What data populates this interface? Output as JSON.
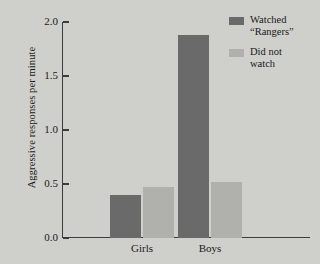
{
  "chart_data": {
    "type": "bar",
    "title": "",
    "xlabel": "",
    "ylabel": "Aggressive responses per minute",
    "categories": [
      "Girls",
      "Boys"
    ],
    "series": [
      {
        "name": "Watched “Rangers”",
        "values": [
          0.4,
          1.88
        ],
        "color": "#6a6a6a"
      },
      {
        "name": "Did not watch",
        "values": [
          0.47,
          0.52
        ],
        "color": "#b0b0ad"
      }
    ],
    "ylim": [
      0.0,
      2.0
    ],
    "yticks": [
      0.0,
      0.5,
      1.0,
      1.5,
      2.0
    ],
    "ytick_labels": [
      "0.0",
      "0.5",
      "1.0",
      "1.5",
      "2.0"
    ],
    "grid": false,
    "legend_position": "top-right",
    "legend": [
      {
        "label": "Watched\n“Rangers”",
        "color": "#6a6a6a"
      },
      {
        "label": "Did not\nwatch",
        "color": "#b0b0ad"
      }
    ],
    "background_color": "#cfcfcb",
    "axis_color": "#3b3b3b"
  }
}
